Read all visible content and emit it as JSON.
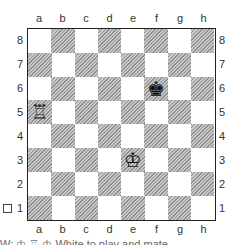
{
  "board": {
    "files": [
      "a",
      "b",
      "c",
      "d",
      "e",
      "f",
      "g",
      "h"
    ],
    "ranks": [
      "8",
      "7",
      "6",
      "5",
      "4",
      "3",
      "2",
      "1"
    ],
    "pieces": [
      {
        "square": "f6",
        "piece": "black-king",
        "glyph": "♚"
      },
      {
        "square": "a5",
        "piece": "white-rook",
        "glyph": "♖"
      },
      {
        "square": "e3",
        "piece": "white-king",
        "glyph": "♔"
      }
    ],
    "colors": {
      "dark_square": "#bdbdbd",
      "light_square": "#ffffff",
      "border": "#222222"
    }
  },
  "side_to_move_checkbox": {
    "checked": false
  },
  "caption": {
    "text": "W: ♔ ♖ ♔ White to play and mate"
  }
}
